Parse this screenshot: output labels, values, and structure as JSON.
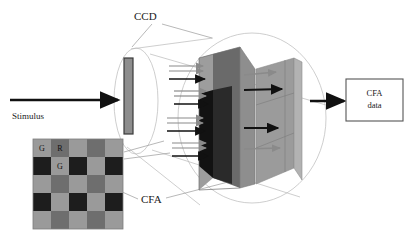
{
  "figure": {
    "title_labels": {
      "ccd": "CCD",
      "stimulus": "Stimulus",
      "cfa": "CFA"
    },
    "output_box": {
      "line1": "CFA",
      "line2": "data"
    },
    "cfa_mosaic": {
      "rows": 5,
      "cols": 5,
      "cell_px": 18,
      "origin": {
        "x": 33,
        "y": 139
      },
      "letters": [
        {
          "text": "G",
          "row": 0,
          "col": 0
        },
        {
          "text": "R",
          "row": 0,
          "col": 1
        },
        {
          "text": "G",
          "row": 1,
          "col": 1
        }
      ],
      "pattern": [
        [
          "light",
          "mid",
          "light",
          "mid",
          "light"
        ],
        [
          "dark",
          "light",
          "dark",
          "light",
          "dark"
        ],
        [
          "light",
          "mid",
          "light",
          "mid",
          "light"
        ],
        [
          "dark",
          "light",
          "dark",
          "light",
          "dark"
        ],
        [
          "light",
          "mid",
          "light",
          "mid",
          "light"
        ]
      ]
    },
    "colors": {
      "cell_light": "#9a9a9a",
      "cell_mid": "#6e6e6e",
      "cell_dark": "#1d1d1d",
      "sensor_bar": "#8d8d8d",
      "sensor_bar_edge": "#3a3a3a",
      "plane_front_light": "#9d9d9d",
      "plane_front_mid": "#6a6a6a",
      "plane_front_dark": "#121212",
      "plane_back": "#9b9b9b",
      "plane_back_edge": "#b7b7b7",
      "arrow_dark": "#111111",
      "arrow_gray": "#8a8a8a",
      "cone_line": "#b9b9b9",
      "leader_line": "#9a9a9a",
      "box_stroke": "#555555",
      "text": "#1a1a1a"
    }
  }
}
